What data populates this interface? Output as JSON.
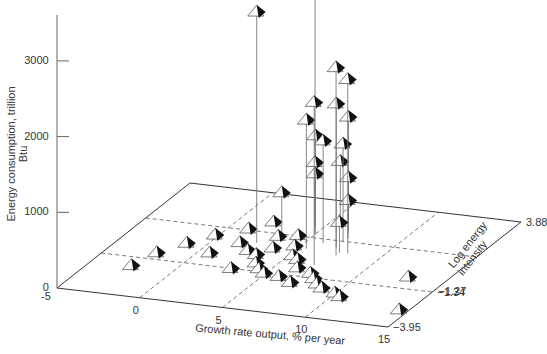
{
  "chart_data": {
    "type": "scatter3d",
    "title": "",
    "xlabel": "Growth rate output, % per year",
    "ylabel": "Energy consumption, trillion Btu",
    "zlabel": "Log energy intensity",
    "x_ticks": [
      "-5",
      "0",
      "5",
      "10",
      "15"
    ],
    "y_ticks": [
      "0",
      "1000",
      "2000",
      "3000"
    ],
    "z_ticks": [
      "-3.95",
      "-1.34",
      "-1.27",
      "3.88"
    ],
    "xlim": [
      -5,
      15
    ],
    "ylim": [
      0,
      3500
    ],
    "zlim": [
      -3.95,
      3.88
    ],
    "grid": "dashed floor grid",
    "marker": "half-filled triangle with drop line to floor",
    "points": [
      {
        "x": 2.5,
        "log": 0.5,
        "energy": 3050
      },
      {
        "x": 5.0,
        "log": 1.5,
        "energy": 3500
      },
      {
        "x": 7.5,
        "log": 0.3,
        "energy": 2480
      },
      {
        "x": 8.0,
        "log": 0.5,
        "energy": 2300
      },
      {
        "x": 7.0,
        "log": -0.5,
        "energy": 2150
      },
      {
        "x": 5.5,
        "log": 0.5,
        "energy": 1700
      },
      {
        "x": 7.0,
        "log": 0.8,
        "energy": 1900
      },
      {
        "x": 6.5,
        "log": 2.0,
        "energy": 1500
      },
      {
        "x": 6.0,
        "log": 1.0,
        "energy": 1350
      },
      {
        "x": 7.0,
        "log": 1.2,
        "energy": 1300
      },
      {
        "x": 4.0,
        "log": 2.5,
        "energy": 1100
      },
      {
        "x": 5.0,
        "log": 1.5,
        "energy": 950
      },
      {
        "x": 3.5,
        "log": 1.0,
        "energy": 600
      },
      {
        "x": 4.5,
        "log": 2.0,
        "energy": 700
      },
      {
        "x": 5.5,
        "log": 2.5,
        "energy": 800
      },
      {
        "x": 6.5,
        "log": 2.0,
        "energy": 700
      },
      {
        "x": 7.0,
        "log": 1.5,
        "energy": 500
      },
      {
        "x": 7.5,
        "log": 0.5,
        "energy": 400
      },
      {
        "x": 1.0,
        "log": -0.8,
        "energy": 60
      },
      {
        "x": 0.0,
        "log": 0.5,
        "energy": 40
      },
      {
        "x": -1.0,
        "log": -0.2,
        "energy": 30
      },
      {
        "x": -2.0,
        "log": -1.0,
        "energy": 20
      },
      {
        "x": -2.5,
        "log": -2.0,
        "energy": 15
      },
      {
        "x": 2.0,
        "log": 0.0,
        "energy": 80
      },
      {
        "x": 3.0,
        "log": -0.5,
        "energy": 90
      },
      {
        "x": 2.5,
        "log": 1.5,
        "energy": 100
      },
      {
        "x": 3.5,
        "log": -0.5,
        "energy": 50
      },
      {
        "x": 4.0,
        "log": -1.0,
        "energy": 40
      },
      {
        "x": 4.5,
        "log": -1.3,
        "energy": 30
      },
      {
        "x": 5.0,
        "log": -1.5,
        "energy": 20
      },
      {
        "x": 3.0,
        "log": -1.5,
        "energy": 30
      },
      {
        "x": 4.0,
        "log": 0.0,
        "energy": 60
      },
      {
        "x": 5.0,
        "log": 0.3,
        "energy": 60
      },
      {
        "x": 6.0,
        "log": -0.5,
        "energy": 50
      },
      {
        "x": 6.5,
        "log": -1.0,
        "energy": 40
      },
      {
        "x": 7.5,
        "log": -1.2,
        "energy": 30
      },
      {
        "x": 8.0,
        "log": -1.5,
        "energy": 25
      },
      {
        "x": 8.5,
        "log": -1.8,
        "energy": 20
      },
      {
        "x": 9.0,
        "log": -2.0,
        "energy": 15
      },
      {
        "x": 10.0,
        "log": -2.2,
        "energy": 10
      },
      {
        "x": 10.5,
        "log": -2.4,
        "energy": 10
      },
      {
        "x": 13.0,
        "log": -0.8,
        "energy": 50
      },
      {
        "x": 14.5,
        "log": -2.8,
        "energy": 10
      },
      {
        "x": 1.5,
        "log": 1.0,
        "energy": 70
      },
      {
        "x": 5.5,
        "log": -0.3,
        "energy": 50
      },
      {
        "x": 6.0,
        "log": -1.6,
        "energy": 20
      },
      {
        "x": 7.0,
        "log": -1.9,
        "energy": 20
      },
      {
        "x": 3.5,
        "log": 0.8,
        "energy": 60
      },
      {
        "x": 4.5,
        "log": 1.0,
        "energy": 60
      }
    ]
  }
}
